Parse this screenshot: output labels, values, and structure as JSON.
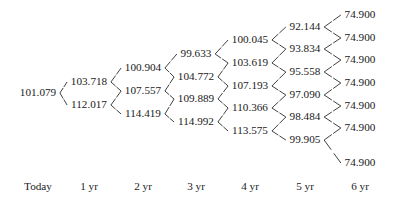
{
  "figure": {
    "type": "binomial-lattice-tree"
  },
  "axis": {
    "labels": [
      "Today",
      "1 yr",
      "2 yr",
      "3 yr",
      "4 yr",
      "5 yr",
      "6 yr"
    ],
    "x_positions": [
      38,
      89,
      143,
      196,
      250,
      305,
      360
    ],
    "y": 187
  },
  "chart_data": {
    "type": "tree",
    "title": "",
    "xlabel": "",
    "ylabel": "",
    "categories": [
      "Today",
      "1 yr",
      "2 yr",
      "3 yr",
      "4 yr",
      "5 yr",
      "6 yr"
    ],
    "columns": [
      {
        "step": 0,
        "label": "Today",
        "x": 38,
        "values": [
          "101.079"
        ],
        "y_positions": [
          93
        ]
      },
      {
        "step": 1,
        "label": "1 yr",
        "x": 89,
        "values": [
          "103.718",
          "112.017"
        ],
        "y_positions": [
          82,
          105
        ]
      },
      {
        "step": 2,
        "label": "2 yr",
        "x": 143,
        "values": [
          "100.904",
          "107.557",
          "114.419"
        ],
        "y_positions": [
          68,
          91,
          114
        ]
      },
      {
        "step": 3,
        "label": "3 yr",
        "x": 196,
        "values": [
          "99.633",
          "104.772",
          "109.889",
          "114.992"
        ],
        "y_positions": [
          54,
          77,
          99,
          122
        ]
      },
      {
        "step": 4,
        "label": "4 yr",
        "x": 250,
        "values": [
          "100.045",
          "103.619",
          "107.193",
          "110.366",
          "113.575"
        ],
        "y_positions": [
          40,
          63,
          86,
          108,
          131
        ]
      },
      {
        "step": 5,
        "label": "5 yr",
        "x": 305,
        "values": [
          "92.144",
          "93.834",
          "95.558",
          "97.090",
          "98.484",
          "99.905"
        ],
        "y_positions": [
          27,
          49,
          72,
          95,
          117,
          140
        ]
      },
      {
        "step": 6,
        "label": "6 yr",
        "x": 360,
        "values": [
          "74.900",
          "74.900",
          "74.900",
          "74.900",
          "74.900",
          "74.900",
          "74.900"
        ],
        "y_positions": [
          15,
          38,
          60,
          83,
          106,
          128,
          163
        ]
      }
    ]
  },
  "style": {
    "text_color": "#1a1a1a",
    "branch_color": "#2b2b2b",
    "background": "#ffffff"
  }
}
